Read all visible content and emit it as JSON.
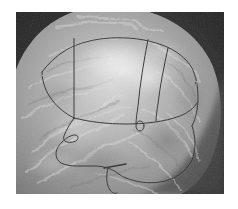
{
  "page": {
    "width": 238,
    "height": 209,
    "background_color": "#ffffff",
    "type": "medical-image-with-annotation",
    "modality_appearance": "grayscale-mammogram"
  },
  "image": {
    "name": "annotated-grayscale-scan",
    "frame": {
      "x": 16,
      "y": 12,
      "width": 208,
      "height": 182
    },
    "description": "Grayscale breast-tissue scan with a large bright ovoid structure filling the frame and dark background wedges at the upper-left, upper-right and lower-right corners.",
    "colors": {
      "background_dark": "#2b2b2b",
      "tissue_mid": "#919191",
      "tissue_light": "#b4b4b4",
      "tissue_bright": "#d6d6d6",
      "tissue_highlight": "#e8e8e8",
      "tissue_shadow": "#6d6d6d",
      "annotation_line": "#3a3a3a",
      "border_white": "#ffffff"
    },
    "annotation": {
      "style": "hand-drawn thin dark outline",
      "line_width": 1,
      "line_color": "#3a3a3a",
      "regions": [
        {
          "name": "left-wedge-segment",
          "label": ""
        },
        {
          "name": "upper-central-bright-segment",
          "label": ""
        },
        {
          "name": "fan-segment-1",
          "label": ""
        },
        {
          "name": "fan-segment-2",
          "label": ""
        },
        {
          "name": "fan-segment-3",
          "label": ""
        },
        {
          "name": "lower-body-outline",
          "label": ""
        }
      ],
      "markers": [
        {
          "name": "small-circle-marker",
          "cx": 124,
          "cy": 114,
          "rx": 4,
          "ry": 5
        }
      ],
      "paths": {
        "main_outline": "M 118 35 C 140 32 162 36 177 48 C 192 60 196 78 196 96 C 196 116 192 134 183 146 C 174 158 160 164 146 164 C 134 164 124 160 116 154",
        "lower_left_chain": "M 116 154 C 110 158 104 162 98 162 C 92 162 86 158 80 154 L 72 150 L 64 150 L 58 146 L 56 138 L 60 130 L 64 124 L 60 118 L 56 112 L 58 104 L 62 96 L 66 88 L 70 80 L 74 72",
        "hook_tail": "M 110 162 C 108 170 110 178 116 182",
        "top_edge": "M 40 52 L 58 40 L 78 34 L 98 32 L 118 35"
      }
    }
  },
  "annotations_meta": {
    "visible_text": "",
    "visible_labels": []
  }
}
